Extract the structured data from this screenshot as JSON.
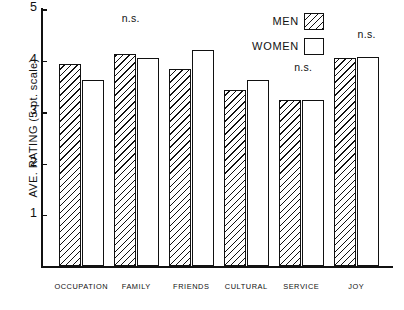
{
  "chart_data": {
    "type": "bar",
    "title": "",
    "xlabel": "",
    "ylabel": "AVE. RATING (5-pt. scale)",
    "ylim": [
      0,
      5
    ],
    "yticks": [
      1,
      2,
      3,
      4,
      5
    ],
    "ytick_labels": [
      "1",
      "2",
      "3",
      "4",
      "5"
    ],
    "grid": false,
    "legend_position": "top-right",
    "categories": [
      "OCCUPATION",
      "FAMILY",
      "FRIENDS",
      "CULTURAL",
      "SERVICE",
      "JOY"
    ],
    "series": [
      {
        "name": "MEN",
        "fill": "diagonal-hatch",
        "values": [
          3.93,
          4.14,
          3.84,
          3.43,
          3.23,
          4.05
        ]
      },
      {
        "name": "WOMEN",
        "fill": "white",
        "values": [
          3.63,
          4.06,
          4.22,
          3.62,
          3.23,
          4.07
        ]
      }
    ],
    "annotations": [
      {
        "text": "n.s.",
        "category": "FAMILY",
        "x_frac": 0.255,
        "y_value": 4.72
      },
      {
        "text": "n.s.",
        "category": "SERVICE",
        "x_frac": 0.745,
        "y_value": 3.76
      },
      {
        "text": "n.s.",
        "category": "JOY",
        "x_frac": 0.925,
        "y_value": 4.41
      }
    ]
  },
  "legend": {
    "items": [
      {
        "label": "MEN",
        "swatch": "hatched-square"
      },
      {
        "label": "WOMEN",
        "swatch": "empty-square"
      }
    ]
  },
  "axis": {
    "y_title": "AVE. RATING (5-pt. scale)",
    "tick_labels": [
      "5",
      "4",
      "3",
      "2",
      "1"
    ]
  },
  "colors": {
    "ink": "#111111",
    "paper": "#ffffff"
  }
}
